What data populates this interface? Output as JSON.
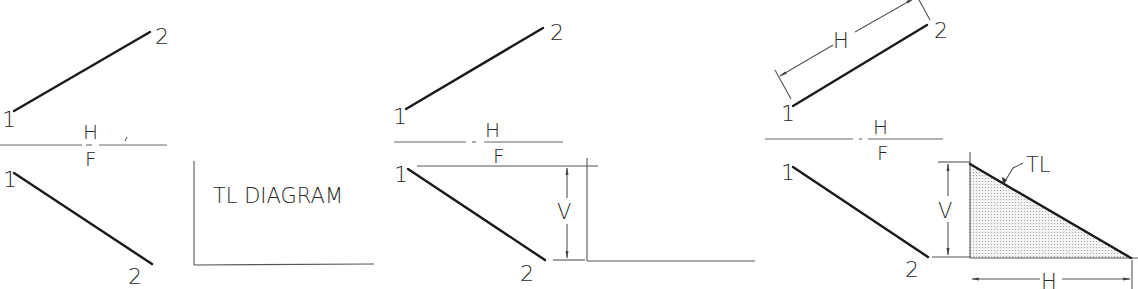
{
  "figure": {
    "panels": [
      {
        "id": "step-1",
        "top_view": {
          "point_1": "1",
          "point_2": "2"
        },
        "fold_line": {
          "upper": "H",
          "lower": "F"
        },
        "front_view": {
          "point_1": "1",
          "point_2": "2"
        },
        "diagram_label": "TL DIAGRAM"
      },
      {
        "id": "step-2",
        "top_view": {
          "point_1": "1",
          "point_2": "2"
        },
        "fold_line": {
          "upper": "H",
          "lower": "F"
        },
        "front_view": {
          "point_1": "1",
          "point_2": "2"
        },
        "dimension_label": "V"
      },
      {
        "id": "step-3",
        "top_view": {
          "point_1": "1",
          "point_2": "2",
          "dimension_label": "H"
        },
        "fold_line": {
          "upper": "H",
          "lower": "F"
        },
        "front_view": {
          "point_1": "1",
          "point_2": "2"
        },
        "triangle": {
          "vertical_label": "V",
          "horizontal_label": "H",
          "hypotenuse_label": "TL"
        }
      }
    ]
  }
}
